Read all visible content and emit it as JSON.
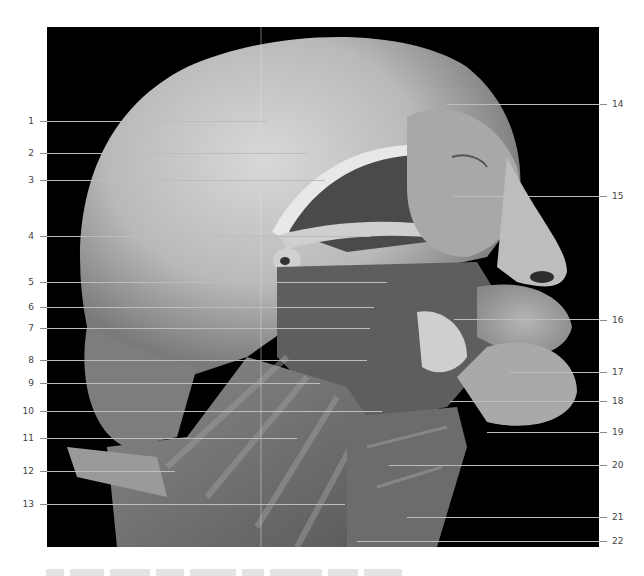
{
  "figure": {
    "image_tone": "grayscale",
    "background_color": "#000000",
    "label_color": "#444444",
    "leader_color": "#bdbdbd",
    "caption_visible": false
  },
  "labels_left": [
    {
      "num": "1"
    },
    {
      "num": "2"
    },
    {
      "num": "3"
    },
    {
      "num": "4"
    },
    {
      "num": "5"
    },
    {
      "num": "6"
    },
    {
      "num": "7"
    },
    {
      "num": "8"
    },
    {
      "num": "9"
    },
    {
      "num": "10"
    },
    {
      "num": "11"
    },
    {
      "num": "12"
    },
    {
      "num": "13"
    }
  ],
  "labels_right": [
    {
      "num": "14"
    },
    {
      "num": "15"
    },
    {
      "num": "16"
    },
    {
      "num": "17"
    },
    {
      "num": "18"
    },
    {
      "num": "19"
    },
    {
      "num": "20"
    },
    {
      "num": "21"
    },
    {
      "num": "22"
    }
  ]
}
